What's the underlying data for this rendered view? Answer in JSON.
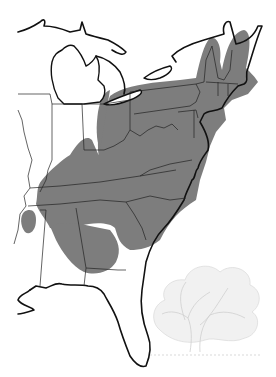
{
  "map": {
    "title": "",
    "region": "Eastern United States",
    "subject": "Tree species native range",
    "colors": {
      "background": "#ffffff",
      "range_fill": "#7d7d7d",
      "coastline": "#111111",
      "state_borders": "#222222",
      "tree_illustration": "#d0d0d0"
    },
    "layers": [
      {
        "name": "native-range",
        "description": "Shaded gray distribution area"
      },
      {
        "name": "state-borders",
        "description": "Thin state boundary lines"
      },
      {
        "name": "coastline",
        "description": "Bold coastline and Great Lakes shoreline"
      },
      {
        "name": "tree-illustration",
        "description": "Faint pencil sketch of a broad-crowned tree, lower right"
      }
    ],
    "legend": null,
    "labels": []
  }
}
